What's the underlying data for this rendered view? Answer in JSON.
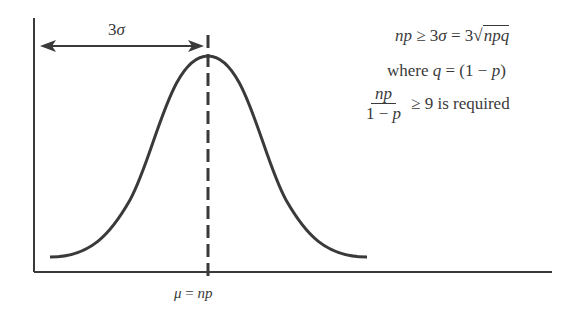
{
  "diagram": {
    "spread_label": {
      "coef": "3",
      "symbol": "σ"
    },
    "mean_label": {
      "mu": "μ",
      "eq": " = ",
      "rhs": "np"
    },
    "equation1": {
      "lhs": "np",
      "op1": " ≥ 3",
      "sigma": "σ",
      "op2": " = 3√",
      "radicand": "npq"
    },
    "equation2": {
      "prefix": "where ",
      "var": "q",
      "mid": " = (1 − ",
      "p": "p",
      "close": ")"
    },
    "equation3": {
      "numerator": "np",
      "denominator_prefix": "1 − ",
      "denominator_var": "p",
      "suffix": " ≥ 9 is required"
    },
    "colors": {
      "ink": "#3a3a3a",
      "background": "#ffffff"
    }
  }
}
